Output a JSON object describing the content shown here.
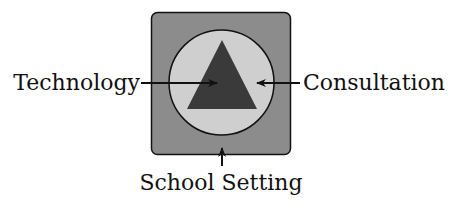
{
  "diagram": {
    "labels": {
      "left": "Technology",
      "right": "Consultation",
      "bottom": "School Setting"
    },
    "shapes": {
      "outer_square": {
        "fill": "#8c8c8c",
        "stroke": "#111111"
      },
      "circle": {
        "fill": "#cfcfcf",
        "stroke": "#111111"
      },
      "triangle": {
        "fill": "#3a3a3a"
      }
    }
  }
}
